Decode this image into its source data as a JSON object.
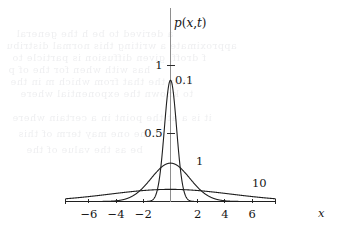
{
  "figure": {
    "name": "diffusion-kernel-plot",
    "function_label": "p(x,t)",
    "x_axis_label": "x",
    "background_color": "#ffffff",
    "curve_color": "#1f1f1f",
    "axis_color": "#2b2b2b",
    "yaxis_color": "#8e8e8e"
  },
  "axes": {
    "x_ticks": [
      {
        "label": "−6",
        "value": -6
      },
      {
        "label": "−4",
        "value": -4
      },
      {
        "label": "−2",
        "value": -2
      },
      {
        "label": "2",
        "value": 2
      },
      {
        "label": "4",
        "value": 4
      },
      {
        "label": "6",
        "value": 6
      }
    ],
    "y_ticks": [
      {
        "label": "0.5",
        "value": 0.5
      },
      {
        "label": "1",
        "value": 1
      }
    ],
    "xlim": [
      -7.7,
      7.7
    ],
    "ylim": [
      0,
      1.4
    ]
  },
  "curve_labels": [
    {
      "text": "0.1",
      "left": 175,
      "top": 75
    },
    {
      "text": "1",
      "left": 196,
      "top": 156
    },
    {
      "text": "10",
      "left": 252,
      "top": 178
    }
  ],
  "ghost_text": [
    {
      "text": "a  derived    to be  h       the  general",
      "left": 16,
      "top": 28
    },
    {
      "text": "approximate    a writing  this   normal  distribu",
      "left": 6,
      "top": 40
    },
    {
      "text": "f       droff, given  diffusion   is particle  to",
      "left": 12,
      "top": 52
    },
    {
      "text": "has     with     when      for     the    of     p",
      "left": 8,
      "top": 64
    },
    {
      "text": "over    the   that    from   which   m     in   the",
      "left": 10,
      "top": 76
    },
    {
      "text": "to     known      the exponential      where",
      "left": 20,
      "top": 88
    },
    {
      "text": "it is   a    at the  point  in   a    certain  where",
      "left": 12,
      "top": 112
    },
    {
      "text": "of    the   one    may     term     of      this",
      "left": 18,
      "top": 128
    },
    {
      "text": "be     as     the     value      of     the",
      "left": 26,
      "top": 144
    }
  ],
  "chart_data": {
    "type": "line",
    "title": "",
    "xlabel": "x",
    "ylabel": "p(x,t)",
    "xlim": [
      -7.7,
      7.7
    ],
    "ylim": [
      0,
      1.4
    ],
    "grid": false,
    "legend_position": "inline-annotations",
    "x_tick_values": [
      -6,
      -4,
      -2,
      2,
      4,
      6
    ],
    "y_tick_values": [
      0.5,
      1
    ],
    "series": [
      {
        "name": "0.1",
        "t": 0.1,
        "peak_value": 1.2616,
        "label": "0.1",
        "x": [
          -7.7,
          -7.0,
          -6.0,
          -5.0,
          -4.0,
          -3.0,
          -2.5,
          -2.0,
          -1.75,
          -1.5,
          -1.25,
          -1.0,
          -0.875,
          -0.75,
          -0.625,
          -0.5,
          -0.375,
          -0.25,
          -0.125,
          0,
          0.125,
          0.25,
          0.375,
          0.5,
          0.625,
          0.75,
          0.875,
          1.0,
          1.25,
          1.5,
          1.75,
          2.0,
          2.5,
          3.0,
          4.0,
          5.0,
          6.0,
          7.0,
          7.7
        ],
        "y": [
          0,
          0,
          0,
          0,
          0,
          0,
          0,
          0.0002,
          0.0014,
          0.0084,
          0.0406,
          0.1554,
          0.2674,
          0.4288,
          0.6403,
          0.8862,
          1.1356,
          1.345,
          1.2316,
          1.2616,
          1.2316,
          1.1356,
          0.9443,
          0.8862,
          0.6403,
          0.4288,
          0.2674,
          0.1554,
          0.0406,
          0.0084,
          0.0014,
          0.0002,
          0,
          0,
          0,
          0,
          0,
          0,
          0
        ]
      },
      {
        "name": "1",
        "t": 1,
        "peak_value": 0.3989,
        "label": "1",
        "x": [
          -7.7,
          -7.0,
          -6.0,
          -5.0,
          -4.5,
          -4.0,
          -3.5,
          -3.0,
          -2.5,
          -2.0,
          -1.5,
          -1.0,
          -0.5,
          0,
          0.5,
          1.0,
          1.5,
          2.0,
          2.5,
          3.0,
          3.5,
          4.0,
          4.5,
          5.0,
          6.0,
          7.0,
          7.7
        ],
        "y": [
          0,
          0,
          0.0002,
          0.0022,
          0.0051,
          0.0135,
          0.0302,
          0.0648,
          0.121,
          0.2076,
          0.3011,
          0.3521,
          0.3848,
          0.3989,
          0.3848,
          0.3521,
          0.3011,
          0.2076,
          0.121,
          0.0648,
          0.0302,
          0.0135,
          0.0051,
          0.0022,
          0.0002,
          0,
          0
        ]
      },
      {
        "name": "10",
        "t": 10,
        "peak_value": 0.1262,
        "label": "10",
        "x": [
          -7.7,
          -7.0,
          -6.5,
          -6.0,
          -5.5,
          -5.0,
          -4.5,
          -4.0,
          -3.5,
          -3.0,
          -2.5,
          -2.0,
          -1.5,
          -1.0,
          -0.5,
          0,
          0.5,
          1.0,
          1.5,
          2.0,
          2.5,
          3.0,
          3.5,
          4.0,
          4.5,
          5.0,
          5.5,
          6.0,
          6.5,
          7.0,
          7.7
        ],
        "y": [
          0.0286,
          0.0368,
          0.0414,
          0.0463,
          0.0513,
          0.0565,
          0.0618,
          0.0671,
          0.0723,
          0.0775,
          0.0733,
          0.087,
          0.0954,
          0.1107,
          0.1223,
          0.1262,
          0.1223,
          0.1107,
          0.0954,
          0.087,
          0.0733,
          0.0775,
          0.0723,
          0.0671,
          0.0618,
          0.0565,
          0.0513,
          0.0463,
          0.0414,
          0.0368,
          0.0286
        ]
      }
    ]
  }
}
